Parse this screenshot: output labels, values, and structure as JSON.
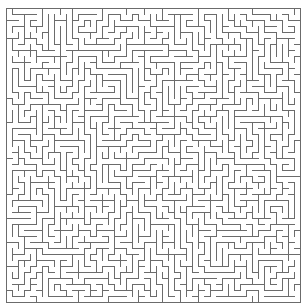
{
  "page": {
    "background_color": "#ffffff",
    "width": 308,
    "height": 306
  },
  "maze": {
    "type": "perfect-maze",
    "algorithm": "recursive-backtracker",
    "seed": 20240917,
    "columns": 49,
    "rows": 49,
    "cell_size": 6,
    "origin_x": 6,
    "origin_y": 8,
    "wall_color": "#6b6b6b",
    "wall_thickness": 1,
    "background_color": "#ffffff",
    "border": {
      "top": true,
      "right": true,
      "bottom": true,
      "left": true
    },
    "entrance": {
      "side": "none",
      "index": 0
    },
    "exit": {
      "side": "none",
      "index": 0
    }
  }
}
